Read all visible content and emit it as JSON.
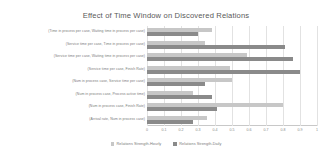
{
  "chart_data": {
    "type": "bar",
    "orientation": "horizontal",
    "title": "Effect of Time Window on Discovered Relations",
    "xlabel": "",
    "ylabel": "",
    "xlim": [
      0,
      1
    ],
    "xticks": [
      "0",
      "0.1",
      "0.2",
      "0.3",
      "0.4",
      "0.5",
      "0.6",
      "0.7",
      "0.8",
      "0.9",
      "1"
    ],
    "grid": true,
    "legend_position": "bottom",
    "categories": [
      "(Time in process per case, Waiting time in process per case)",
      "(Service time per case, Time in process per case)",
      "(Service time per case, Waiting time in process per case)",
      "(Service time per case, Finish Rate)",
      "(Num in process case, Service time per case)",
      "(Num in process case, Process active time)",
      "(Num in process case, Finish Rate)",
      "(Arrival rate, Num in process case)"
    ],
    "series": [
      {
        "name": "Relations Strength-Hourly",
        "color": "#c7c7c7",
        "values": [
          0.38,
          0.34,
          0.59,
          0.49,
          0.5,
          0.27,
          0.8,
          0.35
        ]
      },
      {
        "name": "Relations Strength-Daily",
        "color": "#8a8a8a",
        "values": [
          0.3,
          0.81,
          0.86,
          0.9,
          0.34,
          0.38,
          0.41,
          0.27
        ]
      }
    ]
  },
  "colors": {
    "series_hours": "#c7c7c7",
    "series_daily": "#8a8a8a",
    "text": "#7a7a7a",
    "title": "#595959",
    "grid": "#e2e2e2",
    "background": "#ffffff"
  }
}
